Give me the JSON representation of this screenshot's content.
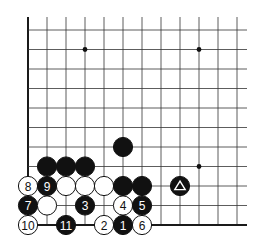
{
  "diagram": {
    "type": "go-board-fragment",
    "corner": "bottom-left",
    "grid": {
      "origin_x": 28,
      "origin_y": 30,
      "col_spacing": 19.0,
      "row_spacing": 19.5,
      "cols": 12,
      "rows": 11,
      "top_extend": 17,
      "right_extend": 247,
      "line_color": "#333333",
      "edge_color": "#1a1a1a"
    },
    "star_points": [
      {
        "col": 3,
        "row": 1
      },
      {
        "col": 9,
        "row": 1
      },
      {
        "col": 9,
        "row": 7
      }
    ],
    "stones": [
      {
        "color": "black",
        "col": 1,
        "row": 7,
        "label": ""
      },
      {
        "color": "black",
        "col": 2,
        "row": 7,
        "label": ""
      },
      {
        "color": "black",
        "col": 3,
        "row": 7,
        "label": ""
      },
      {
        "color": "black",
        "col": 5,
        "row": 6,
        "label": ""
      },
      {
        "color": "white",
        "col": 0,
        "row": 8,
        "label": "8"
      },
      {
        "color": "black",
        "col": 1,
        "row": 8,
        "label": "9"
      },
      {
        "color": "white",
        "col": 2,
        "row": 8,
        "label": ""
      },
      {
        "color": "white",
        "col": 3,
        "row": 8,
        "label": ""
      },
      {
        "color": "white",
        "col": 4,
        "row": 8,
        "label": ""
      },
      {
        "color": "black",
        "col": 5,
        "row": 8,
        "label": ""
      },
      {
        "color": "black",
        "col": 6,
        "row": 8,
        "label": ""
      },
      {
        "color": "black",
        "col": 8,
        "row": 8,
        "label": "",
        "marker": "triangle"
      },
      {
        "color": "black",
        "col": 0,
        "row": 9,
        "label": "7"
      },
      {
        "color": "white",
        "col": 1,
        "row": 9,
        "label": ""
      },
      {
        "color": "black",
        "col": 3,
        "row": 9,
        "label": "3"
      },
      {
        "color": "white",
        "col": 5,
        "row": 9,
        "label": "4"
      },
      {
        "color": "black",
        "col": 6,
        "row": 9,
        "label": "5"
      },
      {
        "color": "white",
        "col": 0,
        "row": 10,
        "label": "10"
      },
      {
        "color": "black",
        "col": 2,
        "row": 10,
        "label": "11"
      },
      {
        "color": "white",
        "col": 4,
        "row": 10,
        "label": "2"
      },
      {
        "color": "black",
        "col": 5,
        "row": 10,
        "label": "1"
      },
      {
        "color": "white",
        "col": 6,
        "row": 10,
        "label": "6"
      }
    ],
    "colors": {
      "black_stone": "#111111",
      "white_stone": "#ffffff",
      "stone_outline": "#111111"
    }
  }
}
